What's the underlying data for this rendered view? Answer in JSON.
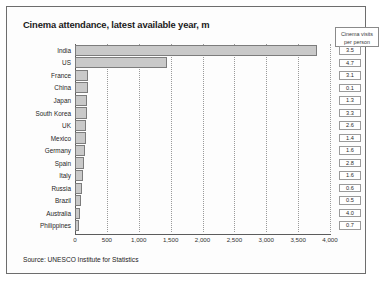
{
  "title": "Cinema attendance, latest available year, m",
  "source": "Source: UNESCO Institute for Statistics",
  "visits_header_line1": "Cinema visits",
  "visits_header_line2": "per person",
  "colors": {
    "bar_fill": "#c9c9c9",
    "bar_border": "#7c7c7c",
    "frame": "#6d6d6d",
    "grid": "#9a9a9a"
  },
  "chart_data": {
    "type": "bar",
    "orientation": "horizontal",
    "title": "Cinema attendance, latest available year, m",
    "xlabel": "",
    "ylabel": "",
    "xlim": [
      0,
      4000
    ],
    "grid": true,
    "legend": "none",
    "categories": [
      "India",
      "US",
      "France",
      "China",
      "Japan",
      "South Korea",
      "UK",
      "Mexico",
      "Germany",
      "Spain",
      "Italy",
      "Russia",
      "Brazil",
      "Australia",
      "Philippines"
    ],
    "values": [
      3800,
      1450,
      210,
      200,
      190,
      185,
      175,
      170,
      160,
      140,
      120,
      110,
      95,
      85,
      70
    ],
    "tick_labels": [
      "0",
      "500",
      "1,000",
      "1,500",
      "2,000",
      "2,500",
      "3,000",
      "3,500",
      "4,000"
    ],
    "tick_values": [
      0,
      500,
      1000,
      1500,
      2000,
      2500,
      3000,
      3500,
      4000
    ],
    "secondary_series": {
      "name": "Cinema visits per person",
      "values": [
        "3.5",
        "4.7",
        "3.1",
        "0.1",
        "1.3",
        "3.3",
        "2.6",
        "1.4",
        "1.6",
        "2.8",
        "1.6",
        "0.6",
        "0.5",
        "4.0",
        "0.7"
      ]
    }
  }
}
